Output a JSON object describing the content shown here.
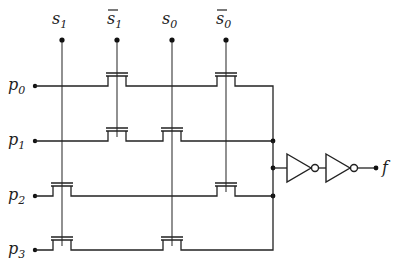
{
  "diagram": {
    "select_inputs": [
      {
        "id": "s1",
        "base": "s",
        "sub": "1",
        "complement": false,
        "x": 62
      },
      {
        "id": "s1_bar",
        "base": "s",
        "sub": "1",
        "complement": true,
        "x": 117
      },
      {
        "id": "s0",
        "base": "s",
        "sub": "0",
        "complement": false,
        "x": 172
      },
      {
        "id": "s0_bar",
        "base": "s",
        "sub": "0",
        "complement": true,
        "x": 226
      }
    ],
    "data_inputs": [
      {
        "id": "p0",
        "base": "p",
        "sub": "0",
        "y": 86
      },
      {
        "id": "p1",
        "base": "p",
        "sub": "1",
        "y": 141
      },
      {
        "id": "p2",
        "base": "p",
        "sub": "2",
        "y": 196
      },
      {
        "id": "p3",
        "base": "p",
        "sub": "3",
        "y": 250
      }
    ],
    "transistors": [
      {
        "row": "p0",
        "gate": "s1_bar"
      },
      {
        "row": "p0",
        "gate": "s0_bar"
      },
      {
        "row": "p1",
        "gate": "s1_bar"
      },
      {
        "row": "p1",
        "gate": "s0"
      },
      {
        "row": "p2",
        "gate": "s1"
      },
      {
        "row": "p2",
        "gate": "s0_bar"
      },
      {
        "row": "p3",
        "gate": "s1"
      },
      {
        "row": "p3",
        "gate": "s0"
      }
    ],
    "buffer": {
      "stages": 2,
      "type": "inverter"
    },
    "output": {
      "label": "f"
    }
  }
}
